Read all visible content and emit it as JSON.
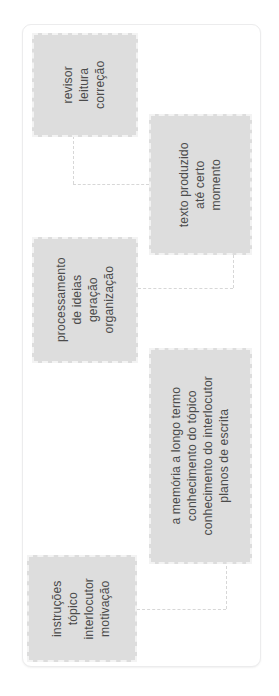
{
  "diagram": {
    "orientation": "rotated-90-ccw",
    "background_color": "#ffffff",
    "node_fill_color": "#dddddd",
    "node_border_color": "#f3f3f3",
    "text_color": "#4b4b4b",
    "connector_color": "#d7d7d7",
    "nodes": [
      {
        "id": "revisor",
        "lines": [
          "revisor",
          "leitura",
          "correção"
        ]
      },
      {
        "id": "texto-produzido",
        "lines": [
          "texto produzido",
          "até certo",
          "momento"
        ]
      },
      {
        "id": "processamento",
        "lines": [
          "processamento",
          "de ideias",
          "geração",
          "organização"
        ]
      },
      {
        "id": "memoria-longo-termo",
        "lines": [
          "a memória a longo termo",
          "conhecimento do tópico",
          "conhecimento do interlocutor",
          "planos de escrita"
        ]
      },
      {
        "id": "instrucoes",
        "lines": [
          "instruções",
          "tópico",
          "interlocutor",
          "motivação"
        ]
      }
    ]
  }
}
